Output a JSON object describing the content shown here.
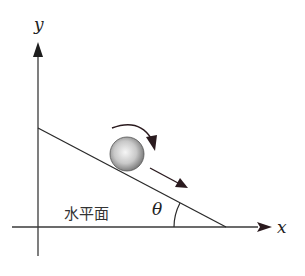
{
  "diagram": {
    "axes": {
      "x_label": "x",
      "y_label": "y"
    },
    "surface_label": "水平面",
    "angle_label": "θ",
    "objects": {
      "ball": "sphere rolling down incline",
      "rotation_arrow": "clockwise",
      "motion_arrow": "down the incline"
    },
    "colors": {
      "line": "#2a2a2a",
      "arrow": "#2a1a1e",
      "ball_light": "#f4f4f4",
      "ball_dark": "#7a7a7a"
    }
  }
}
